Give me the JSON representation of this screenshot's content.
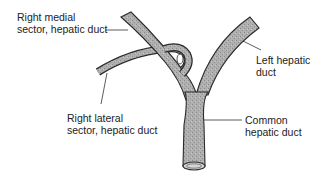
{
  "diagram": {
    "type": "anatomical illustration",
    "colors": {
      "duct_fill": "#a9a9a9",
      "duct_outline": "#2a2a2a",
      "leader_line": "#333333",
      "text": "#222222"
    },
    "labels": [
      {
        "id": "right-medial",
        "lines": [
          "Right medial",
          "sector, hepatic duct"
        ]
      },
      {
        "id": "left-hepatic",
        "lines": [
          "Left hepatic",
          "duct"
        ]
      },
      {
        "id": "right-lateral",
        "lines": [
          "Right lateral",
          "sector, hepatic duct"
        ]
      },
      {
        "id": "common-hepatic",
        "lines": [
          "Common",
          "hepatic duct"
        ]
      }
    ]
  }
}
